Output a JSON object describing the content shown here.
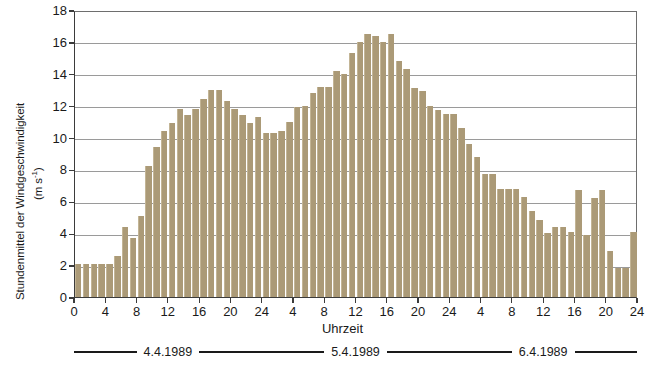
{
  "chart_data": {
    "type": "bar",
    "title": "",
    "xlabel": "Uhrzeit",
    "ylabel": "Stundenmittel der Windgeschwindigkeit (m s-1)",
    "ylabel_main": "Stundenmittel der Windgeschwindigkeit",
    "ylabel_units": "(m s",
    "ylabel_units_exp": "-1",
    "ylabel_units_close": ")",
    "ylim": [
      0,
      18
    ],
    "ytick_values": [
      0,
      2,
      4,
      6,
      8,
      10,
      12,
      14,
      16,
      18
    ],
    "ytick_labels": [
      "0",
      "2",
      "4",
      "6",
      "8",
      "10",
      "12",
      "14",
      "16",
      "18"
    ],
    "grid": true,
    "grid_axis": "y",
    "legend": "none",
    "bar_color": "#ab9a77",
    "axis_color": "#3b3b3b",
    "gridline_color": "#9a9a9a",
    "xlim": [
      0,
      72
    ],
    "xtick_positions": [
      0,
      4,
      8,
      12,
      16,
      20,
      24,
      28,
      32,
      36,
      40,
      44,
      48,
      52,
      56,
      60,
      64,
      68,
      72
    ],
    "xtick_labels": [
      "0",
      "4",
      "8",
      "12",
      "16",
      "20",
      "24",
      "4",
      "8",
      "12",
      "16",
      "20",
      "24",
      "4",
      "8",
      "12",
      "16",
      "20",
      "24"
    ],
    "x": [
      0,
      1,
      2,
      3,
      4,
      5,
      6,
      7,
      8,
      9,
      10,
      11,
      12,
      13,
      14,
      15,
      16,
      17,
      18,
      19,
      20,
      21,
      22,
      23,
      24,
      25,
      26,
      27,
      28,
      29,
      30,
      31,
      32,
      33,
      34,
      35,
      36,
      37,
      38,
      39,
      40,
      41,
      42,
      43,
      44,
      45,
      46,
      47,
      48,
      49,
      50,
      51,
      52,
      53,
      54,
      55,
      56,
      57,
      58,
      59,
      60,
      61,
      62,
      63,
      64,
      65,
      66,
      67,
      68,
      69,
      70,
      71
    ],
    "values": [
      2.1,
      2.1,
      2.1,
      2.1,
      2.1,
      2.6,
      4.4,
      3.7,
      5.1,
      8.2,
      9.4,
      10.4,
      10.9,
      11.8,
      11.4,
      11.8,
      12.4,
      13.0,
      13.0,
      12.3,
      11.8,
      11.4,
      10.9,
      11.3,
      10.3,
      10.3,
      10.4,
      11.0,
      11.9,
      12.0,
      12.8,
      13.2,
      13.2,
      14.2,
      14.0,
      15.3,
      16.0,
      16.5,
      16.4,
      16.0,
      16.5,
      14.8,
      14.3,
      13.1,
      12.9,
      12.0,
      11.7,
      11.5,
      11.5,
      10.6,
      9.6,
      8.8,
      7.7,
      7.7,
      6.8,
      6.8,
      6.8,
      6.3,
      5.4,
      4.8,
      4.0,
      4.4,
      4.4,
      4.1,
      6.7,
      3.9,
      6.2,
      6.7,
      2.9,
      1.8,
      1.8,
      4.1
    ],
    "date_bands": [
      {
        "label": "4.4.1989",
        "start": 0,
        "end": 24
      },
      {
        "label": "5.4.1989",
        "start": 24,
        "end": 48
      },
      {
        "label": "6.4.1989",
        "start": 48,
        "end": 72
      }
    ]
  }
}
